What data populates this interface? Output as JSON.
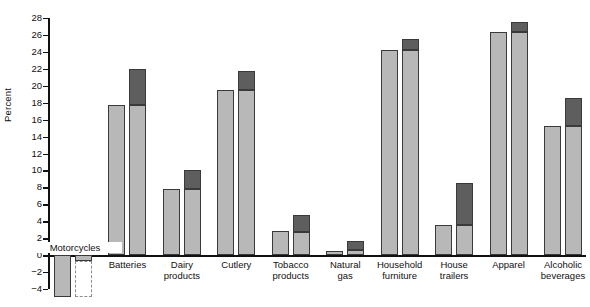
{
  "chart_data": {
    "type": "bar",
    "title": "",
    "xlabel": "",
    "ylabel": "Percent",
    "ylim": [
      -4,
      28
    ],
    "ytick_step": 2,
    "yticks": [
      -4,
      -2,
      0,
      2,
      4,
      6,
      8,
      10,
      12,
      14,
      16,
      18,
      20,
      22,
      24,
      26,
      28
    ],
    "ytick_labels": [
      "−4",
      "−2",
      "0",
      "2",
      "4",
      "6",
      "8",
      "10",
      "12",
      "14",
      "16",
      "18",
      "20",
      "22",
      "24",
      "26",
      "28"
    ],
    "grid": false,
    "legend_position": "none",
    "categories": [
      "Motorcycles",
      "Batteries",
      "Dairy products",
      "Cutlery",
      "Tobacco products",
      "Natural gas",
      "Household furniture",
      "House trailers",
      "Apparel",
      "Alcoholic beverages"
    ],
    "category_label_lines": [
      [
        "Motorcycles"
      ],
      [
        "Batteries"
      ],
      [
        "Dairy",
        "products"
      ],
      [
        "Cutlery"
      ],
      [
        "Tobacco",
        "products"
      ],
      [
        "Natural",
        "gas"
      ],
      [
        "Household",
        "furniture"
      ],
      [
        "House",
        "trailers"
      ],
      [
        "Apparel"
      ],
      [
        "Alcoholic",
        "beverages"
      ]
    ],
    "series": [
      {
        "name": "bar-1-base",
        "style": "light",
        "values": [
          -5.0,
          17.7,
          7.8,
          19.5,
          2.8,
          0.5,
          24.2,
          3.6,
          26.4,
          15.2
        ]
      },
      {
        "name": "bar-2-base",
        "style": "light",
        "values": [
          -0.7,
          17.7,
          7.8,
          19.5,
          2.7,
          0.6,
          24.2,
          3.6,
          26.4,
          15.2
        ]
      },
      {
        "name": "bar-2-increment",
        "style": "dark",
        "values": [
          -4.3,
          4.3,
          2.2,
          2.3,
          2.0,
          1.1,
          1.3,
          4.9,
          1.1,
          3.3
        ]
      }
    ],
    "bar1_is_dashed_outline": [
      false,
      false,
      false,
      false,
      false,
      false,
      false,
      false,
      false,
      false
    ],
    "bar2_is_dashed_outline": [
      true,
      false,
      false,
      false,
      false,
      false,
      false,
      false,
      false,
      false
    ],
    "notes": {
      "motorcycles_bar1_clipped": "extends below plotted range",
      "motorcycles_bar2_dark_clipped": "dashed outline extends below plotted range"
    },
    "colors": {
      "light_fill": "#b8b8b8",
      "dark_fill": "#5e5e5e",
      "outline": "#3a3a3a",
      "dashed_outline": "#8d8d8d",
      "axis": "#111111",
      "background": "#ffffff"
    }
  }
}
